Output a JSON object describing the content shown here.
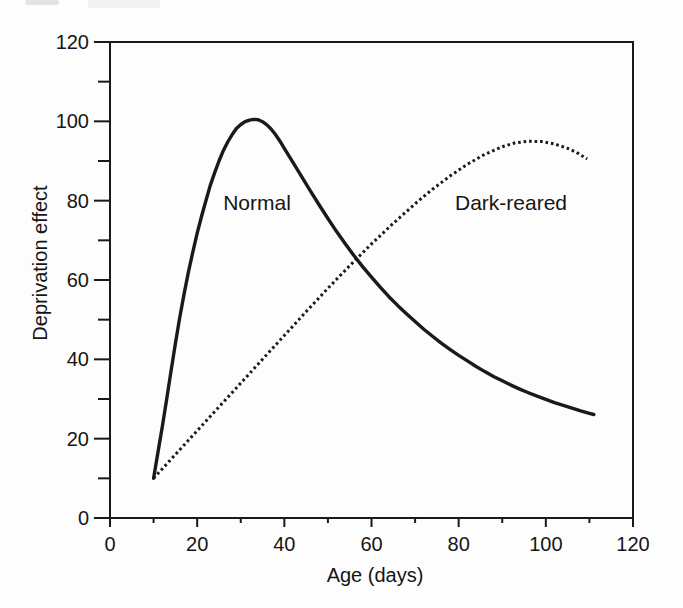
{
  "colors": {
    "ink": "#1a1a1a",
    "background": "#fdfdfd"
  },
  "chart_data": {
    "type": "line",
    "title": "",
    "xlabel": "Age (days)",
    "ylabel": "Deprivation effect",
    "xlim": [
      0,
      120
    ],
    "ylim": [
      0,
      120
    ],
    "grid": false,
    "legend_position": "inline-annotations",
    "x_ticks_major": [
      0,
      20,
      40,
      60,
      80,
      100,
      120
    ],
    "x_ticks_minor": [
      10,
      30,
      50,
      70,
      90,
      110
    ],
    "y_ticks_major": [
      0,
      20,
      40,
      60,
      80,
      100,
      120
    ],
    "y_ticks_minor": [
      10,
      30,
      50,
      70,
      90,
      110
    ],
    "series": [
      {
        "name": "Normal",
        "style": "solid",
        "points": [
          [
            10,
            10
          ],
          [
            11,
            16.5
          ],
          [
            12,
            23
          ],
          [
            13,
            30
          ],
          [
            14,
            37
          ],
          [
            15,
            44
          ],
          [
            16,
            50.5
          ],
          [
            17,
            56.5
          ],
          [
            18,
            62
          ],
          [
            19,
            67
          ],
          [
            20,
            71.8
          ],
          [
            21,
            76
          ],
          [
            22,
            80
          ],
          [
            23,
            83.8
          ],
          [
            24,
            87
          ],
          [
            25,
            90
          ],
          [
            26,
            92.6
          ],
          [
            27,
            94.8
          ],
          [
            28,
            96.6
          ],
          [
            29,
            98.2
          ],
          [
            30,
            99.2
          ],
          [
            31,
            99.9
          ],
          [
            32,
            100.3
          ],
          [
            33,
            100.5
          ],
          [
            34,
            100.4
          ],
          [
            35,
            99.9
          ],
          [
            36,
            99.1
          ],
          [
            37,
            98
          ],
          [
            38,
            96.6
          ],
          [
            39,
            95
          ],
          [
            40,
            93.2
          ],
          [
            42,
            89.6
          ],
          [
            44,
            86
          ],
          [
            46,
            82.4
          ],
          [
            48,
            78.9
          ],
          [
            50,
            75.5
          ],
          [
            52,
            72.2
          ],
          [
            54,
            69.1
          ],
          [
            56,
            66.1
          ],
          [
            58,
            63.3
          ],
          [
            60,
            60.7
          ],
          [
            62,
            58.2
          ],
          [
            64,
            55.8
          ],
          [
            66,
            53.6
          ],
          [
            68,
            51.5
          ],
          [
            70,
            49.5
          ],
          [
            72,
            47.6
          ],
          [
            74,
            45.8
          ],
          [
            76,
            44.1
          ],
          [
            78,
            42.5
          ],
          [
            80,
            41
          ],
          [
            82,
            39.6
          ],
          [
            84,
            38.2
          ],
          [
            86,
            36.9
          ],
          [
            88,
            35.7
          ],
          [
            90,
            34.6
          ],
          [
            92,
            33.5
          ],
          [
            94,
            32.5
          ],
          [
            96,
            31.6
          ],
          [
            98,
            30.7
          ],
          [
            100,
            29.9
          ],
          [
            102,
            29.1
          ],
          [
            104,
            28.4
          ],
          [
            106,
            27.7
          ],
          [
            108,
            27
          ],
          [
            110,
            26.4
          ],
          [
            111,
            26.1
          ]
        ]
      },
      {
        "name": "Dark-reared",
        "style": "dotted",
        "points": [
          [
            10,
            10
          ],
          [
            15,
            16
          ],
          [
            20,
            22
          ],
          [
            25,
            28
          ],
          [
            30,
            34
          ],
          [
            35,
            40
          ],
          [
            40,
            46
          ],
          [
            45,
            52
          ],
          [
            50,
            57.9
          ],
          [
            55,
            63.6
          ],
          [
            60,
            69.1
          ],
          [
            65,
            74.3
          ],
          [
            70,
            79.2
          ],
          [
            74,
            82.9
          ],
          [
            78,
            86.2
          ],
          [
            82,
            89.2
          ],
          [
            86,
            91.7
          ],
          [
            90,
            93.6
          ],
          [
            93,
            94.6
          ],
          [
            96,
            95
          ],
          [
            99,
            94.9
          ],
          [
            102,
            94.3
          ],
          [
            105,
            93.2
          ],
          [
            107,
            92.2
          ],
          [
            109.5,
            90.5
          ]
        ]
      }
    ],
    "annotations": [
      {
        "text": "Normal",
        "x": 33.7,
        "y": 79.7
      },
      {
        "text": "Dark-reared",
        "x": 91.8,
        "y": 79.7
      }
    ]
  }
}
